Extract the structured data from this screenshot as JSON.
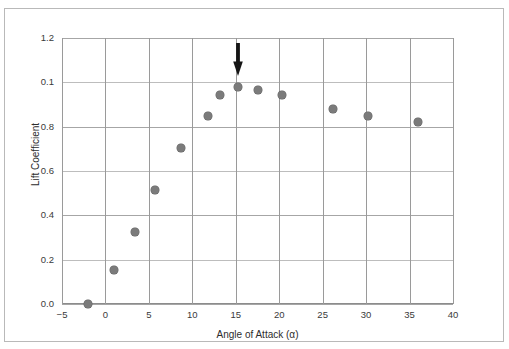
{
  "figure": {
    "y_axis_title": "Lift Coefficient",
    "x_axis_title": "Angle of Attack (α)",
    "annotation_label": "down-arrow-pointing-to-stall-peak"
  },
  "chart_data": {
    "type": "scatter",
    "title": "",
    "xlabel": "Angle of Attack (α)",
    "ylabel": "Lift Coefficient",
    "xlim": [
      -5,
      40
    ],
    "ylim": [
      0.0,
      1.2
    ],
    "grid": true,
    "legend": "none",
    "marker_color": "#7b7b7b",
    "xticks": [
      "−5",
      "0",
      "5",
      "10",
      "15",
      "20",
      "25",
      "30",
      "35",
      "40"
    ],
    "xtick_values": [
      -5,
      0,
      5,
      10,
      15,
      20,
      25,
      30,
      35,
      40
    ],
    "yticks": [
      "0.0",
      "0.2",
      "0.4",
      "0.6",
      "0.8",
      "0.1",
      "1.2"
    ],
    "ytick_values": [
      0.0,
      0.2,
      0.4,
      0.6,
      0.8,
      1.0,
      1.2
    ],
    "x": [
      -2.0,
      1.0,
      3.4,
      5.7,
      8.7,
      11.8,
      13.2,
      15.2,
      17.6,
      20.3,
      26.2,
      30.2,
      36.0
    ],
    "y": [
      0.0,
      0.155,
      0.325,
      0.515,
      0.705,
      0.85,
      0.945,
      0.98,
      0.965,
      0.945,
      0.88,
      0.85,
      0.82
    ],
    "annotations": [
      {
        "type": "arrow",
        "direction": "down",
        "x": 15.2,
        "y_tip": 1.03,
        "color": "#1a1a1a"
      }
    ]
  }
}
